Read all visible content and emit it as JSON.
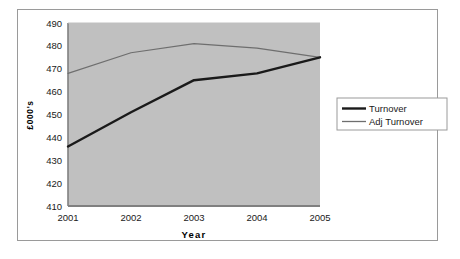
{
  "figure": {
    "background_color": "#ffffff",
    "frame_color": "#9a9a9a",
    "plot_area_color": "#c0c0c0",
    "axis_color": "#808080"
  },
  "chart_data": {
    "type": "line",
    "title": "",
    "xlabel": "Year",
    "ylabel": "£000's",
    "categories": [
      "2001",
      "2002",
      "2003",
      "2004",
      "2005"
    ],
    "x_tick_labels": [
      "2001",
      "2002",
      "2003",
      "2004",
      "2005"
    ],
    "y_tick_labels": [
      "410",
      "420",
      "430",
      "440",
      "450",
      "460",
      "470",
      "480",
      "490"
    ],
    "y_ticks": [
      410,
      420,
      430,
      440,
      450,
      460,
      470,
      480,
      490
    ],
    "ylim": [
      410,
      490
    ],
    "grid": false,
    "legend_position": "right",
    "series": [
      {
        "name": "Turnover",
        "color": "#1a1a1a",
        "line_width": 2.4,
        "values": [
          436,
          451,
          465,
          468,
          475
        ]
      },
      {
        "name": "Adj  Turnover",
        "color": "#6e6e6e",
        "line_width": 1.2,
        "values": [
          468,
          477,
          481,
          479,
          475
        ]
      }
    ]
  },
  "legend": {
    "items": [
      {
        "label": "Turnover",
        "swatch_color": "#1a1a1a"
      },
      {
        "label": "Adj  Turnover",
        "swatch_color": "#6e6e6e"
      }
    ]
  }
}
